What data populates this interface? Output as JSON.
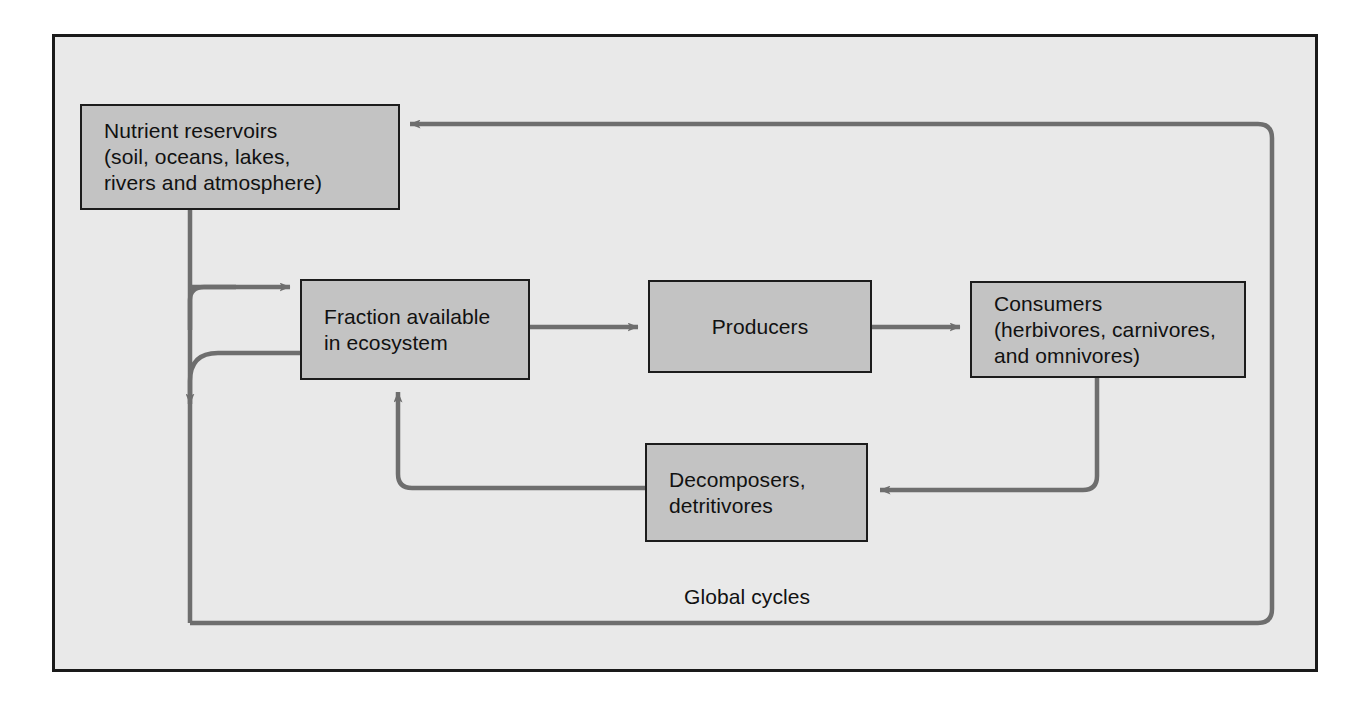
{
  "diagram": {
    "frame": {
      "border_color": "#1a1a1a",
      "background_color": "#e9e9e9"
    },
    "style": {
      "box_fill": "#c3c3c3",
      "box_border": "#1c1c1c",
      "arrow_color": "#6e6e6e"
    },
    "nodes": [
      {
        "id": "reservoirs",
        "label": "Nutrient reservoirs\n(soil, oceans, lakes,\nrivers and atmosphere)"
      },
      {
        "id": "fraction",
        "label": "Fraction available\nin ecosystem"
      },
      {
        "id": "producers",
        "label": "Producers"
      },
      {
        "id": "consumers",
        "label": "Consumers\n(herbivores, carnivores,\nand omnivores)"
      },
      {
        "id": "decomposers",
        "label": "Decomposers,\ndetritivores"
      }
    ],
    "annotations": [
      {
        "id": "global-cycles",
        "label": "Global cycles"
      }
    ],
    "edges": [
      {
        "id": "reservoirs-to-fraction",
        "from": "reservoirs",
        "to": "fraction",
        "label": ""
      },
      {
        "id": "fraction-to-reservoirs-outflow",
        "from": "fraction",
        "to": "global-cycles",
        "label": ""
      },
      {
        "id": "fraction-to-producers",
        "from": "fraction",
        "to": "producers",
        "label": ""
      },
      {
        "id": "producers-to-consumers",
        "from": "producers",
        "to": "consumers",
        "label": ""
      },
      {
        "id": "consumers-to-decomposers",
        "from": "consumers",
        "to": "decomposers",
        "label": ""
      },
      {
        "id": "decomposers-to-fraction",
        "from": "decomposers",
        "to": "fraction",
        "label": ""
      },
      {
        "id": "global-cycles-to-reservoirs",
        "from": "global-cycles",
        "to": "reservoirs",
        "label": ""
      }
    ]
  }
}
